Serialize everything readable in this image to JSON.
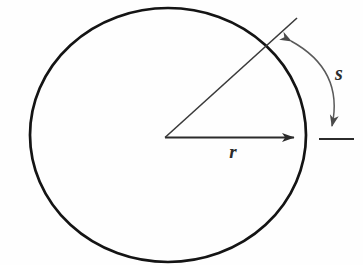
{
  "figure": {
    "title": "circle-arc-radius-diagram",
    "background_color": "#fefefe",
    "stroke_color": "#1a1a1a",
    "arc_stroke_color": "#555555",
    "line_color": "#333333",
    "labels": {
      "radius": "r",
      "arc_length": "s"
    },
    "label_positions": {
      "radius": {
        "x": 233,
        "y": 157
      },
      "arc_length": {
        "x": 338,
        "y": 78
      }
    },
    "circle": {
      "center_x": 168,
      "center_y": 135,
      "radius_x": 138,
      "radius_y": 127,
      "stroke_width": 2.6
    },
    "radius_horizontal": {
      "from_x": 165,
      "from_y": 137,
      "to_x": 305,
      "to_y": 137,
      "stroke_width": 1.9,
      "arrowhead": "right"
    },
    "radius_slanted": {
      "from_x": 165,
      "from_y": 137,
      "to_x": 297,
      "to_y": 18,
      "stroke_width": 1.5,
      "arrowhead": "none",
      "angle_degrees": 42
    },
    "arc_marker": {
      "start_x": 288,
      "start_y": 38,
      "end_x": 333,
      "end_y": 132,
      "control_x": 345,
      "control_y": 72,
      "stroke_width": 1.4,
      "arrowheads": "both"
    },
    "tick_mark": {
      "x1": 319,
      "y1": 139,
      "x2": 354,
      "y2": 139,
      "stroke_width": 1.6
    }
  }
}
